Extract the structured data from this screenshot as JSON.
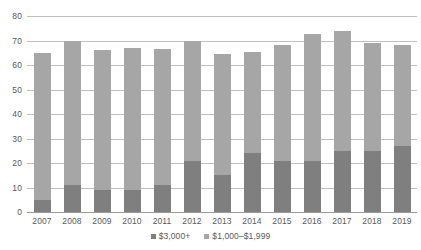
{
  "chart_data": {
    "type": "bar",
    "title": "",
    "subtitle": "",
    "xlabel": "",
    "ylabel": "",
    "stacked": true,
    "grid": true,
    "legend_position": "bottom",
    "ylim": [
      0,
      80
    ],
    "yticks": [
      0,
      10,
      20,
      30,
      40,
      50,
      60,
      70,
      80
    ],
    "ytick_labels": [
      "0",
      "10",
      "20",
      "30",
      "40",
      "50",
      "60",
      "70",
      "80"
    ],
    "categories": [
      "2007",
      "2008",
      "2009",
      "2010",
      "2011",
      "2012",
      "2013",
      "2014",
      "2015",
      "2016",
      "2017",
      "2018",
      "2019"
    ],
    "series": [
      {
        "name": "$3,000+",
        "color": "#7f7f7f",
        "values": [
          5,
          11,
          9,
          9,
          11,
          21,
          15,
          24,
          21,
          21,
          25,
          25,
          27
        ]
      },
      {
        "name": "$1,000–$1,999",
        "color": "#a6a6a6",
        "values": [
          60,
          59,
          57,
          58,
          55.5,
          49,
          49.5,
          41.5,
          47,
          51.5,
          49,
          44,
          41
        ]
      }
    ],
    "totals": [
      65,
      70,
      66,
      67,
      66.5,
      70,
      64.5,
      65.5,
      68,
      72.5,
      74,
      69,
      68
    ]
  },
  "legend": {
    "items": [
      {
        "label": "$3,000+",
        "color": "#7f7f7f"
      },
      {
        "label": "$1,000–$1,999",
        "color": "#a6a6a6"
      }
    ]
  },
  "colors": {
    "series_dark": "#7f7f7f",
    "series_light": "#a6a6a6",
    "gridline": "#bfbfbf",
    "text": "#59595b",
    "background": "#ffffff"
  }
}
